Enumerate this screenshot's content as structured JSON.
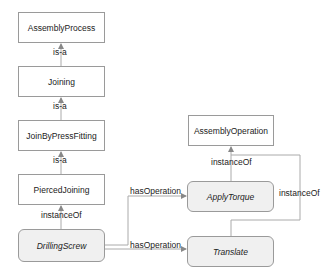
{
  "nodes": {
    "assembly_process": "AssemblyProcess",
    "joining": "Joining",
    "join_by_press_fitting": "JoinByPressFitting",
    "pierced_joining": "PiercedJoining",
    "drilling_screw": "DrillingScrew",
    "assembly_operation": "AssemblyOperation",
    "apply_torque": "ApplyTorque",
    "translate": "Translate"
  },
  "edges": {
    "isa_1": "is-a",
    "isa_2": "is-a",
    "isa_3": "is-a",
    "instance_of_drilling": "instanceOf",
    "has_operation_1": "hasOperation",
    "has_operation_2": "hasOperation",
    "instance_of_apply": "instanceOf",
    "instance_of_translate": "instanceOf"
  },
  "colors": {
    "edge": "#aaaaaa",
    "class_fill": "#ffffff",
    "instance_fill": "#f0f0f0",
    "border": "#9a9a9a"
  }
}
